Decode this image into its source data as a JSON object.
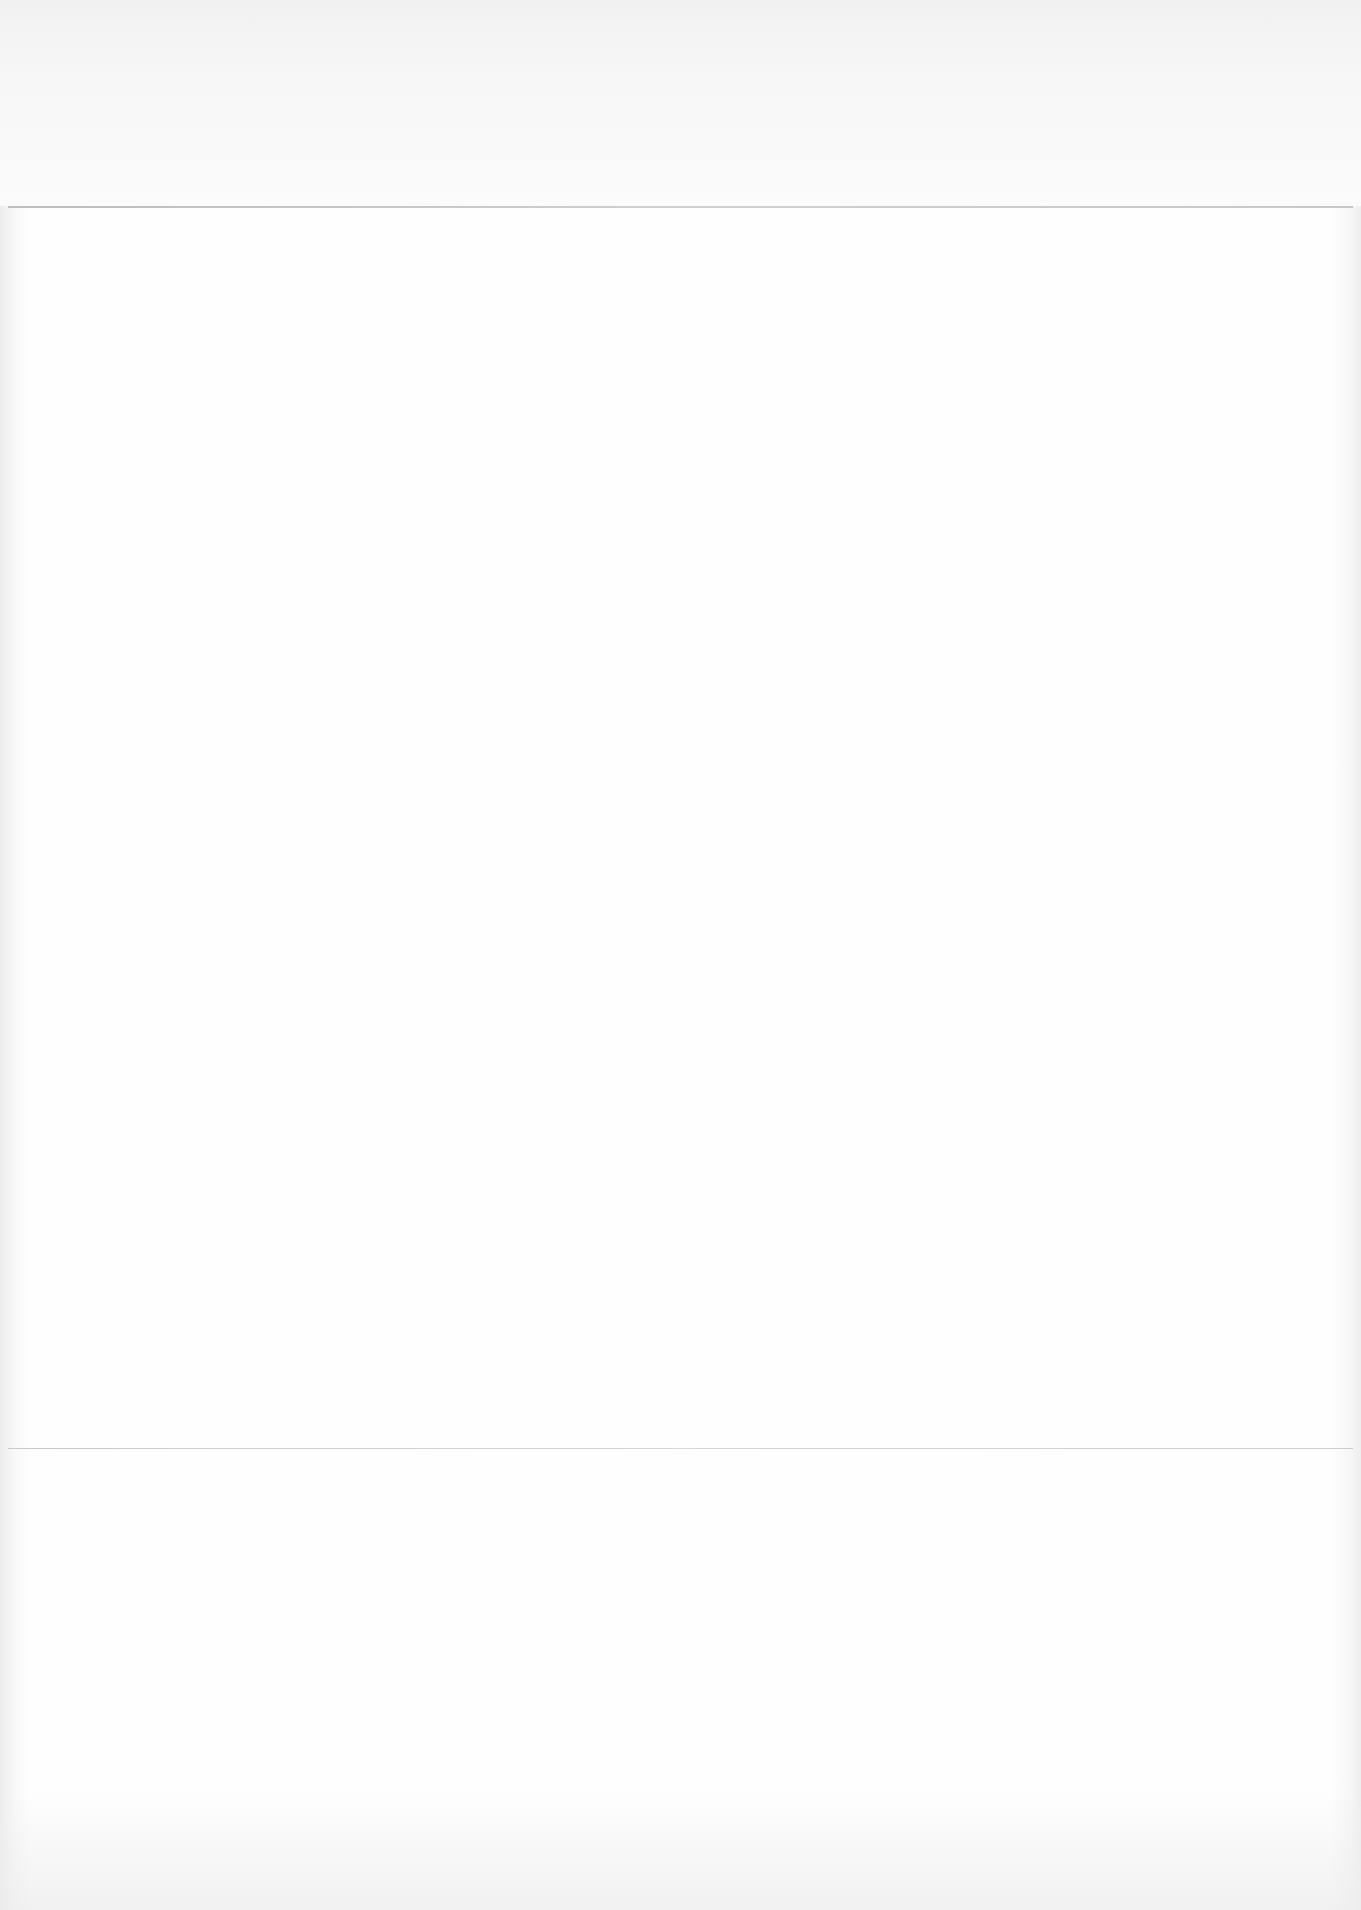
{
  "document": {
    "type": "blank scanned page",
    "text_blocks": [],
    "rules": [
      {
        "position": "top",
        "y": 206
      },
      {
        "position": "bottom",
        "y": 1448
      }
    ]
  }
}
